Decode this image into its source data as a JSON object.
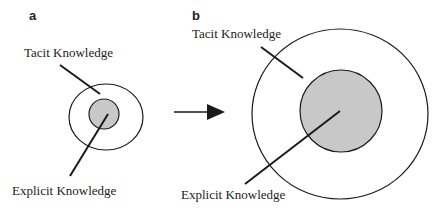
{
  "panels": {
    "a": {
      "label": "a",
      "tacit_label": "Tacit Knowledge",
      "explicit_label": "Explicit Knowledge"
    },
    "b": {
      "label": "b",
      "tacit_label": "Tacit Knowledge",
      "explicit_label": "Explicit Knowledge"
    }
  },
  "colors": {
    "stroke": "#1a1a1a",
    "inner_fill": "#c8c8c8",
    "outer_fill": "#ffffff"
  },
  "arrow": {
    "icon": "arrow-right-icon",
    "direction": "a-to-b"
  }
}
